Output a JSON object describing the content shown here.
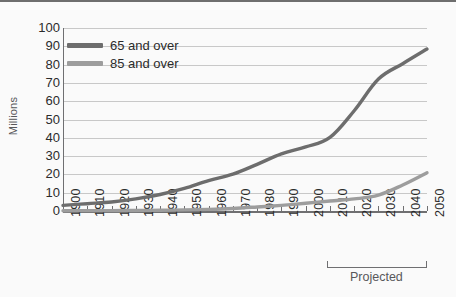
{
  "chart_data": {
    "type": "line",
    "title": "",
    "xlabel": "",
    "ylabel": "Millions",
    "ylim": [
      0,
      100
    ],
    "ytick_step": 10,
    "grid": true,
    "legend_position": "top-left-inside",
    "categories": [
      "1900",
      "1910",
      "1920",
      "1930",
      "1940",
      "1950",
      "1960",
      "1970",
      "1980",
      "1990",
      "2000",
      "2010",
      "2020",
      "2030",
      "2040",
      "2050"
    ],
    "yticks": [
      "0",
      "10",
      "20",
      "30",
      "40",
      "50",
      "60",
      "70",
      "80",
      "90",
      "100"
    ],
    "series": [
      {
        "name": "65 and over",
        "color": "#6d6d6d",
        "values": [
          3.1,
          4.0,
          4.9,
          6.6,
          9.0,
          12.3,
          16.6,
          20.1,
          25.5,
          31.2,
          35.0,
          40.2,
          54.8,
          72.1,
          80.5,
          88.5
        ]
      },
      {
        "name": "85 and over",
        "color": "#9d9d9d",
        "values": [
          0.1,
          0.2,
          0.2,
          0.3,
          0.4,
          0.6,
          0.9,
          1.4,
          2.2,
          3.1,
          4.2,
          5.5,
          6.6,
          8.7,
          14.2,
          20.9
        ]
      }
    ],
    "annotations": [
      {
        "text": "Projected",
        "type": "bracket",
        "from": "2010",
        "to": "2050"
      }
    ]
  },
  "legend": {
    "items": [
      {
        "label": "65 and over"
      },
      {
        "label": "85 and over"
      }
    ]
  },
  "annotation": {
    "projected_label": "Projected"
  },
  "colors": {
    "series_65": "#6d6d6d",
    "series_85": "#9d9d9d",
    "gridline": "#c8c8c8",
    "axis": "#6f6f71",
    "background": "#fafafa",
    "text": "#2b2b2b"
  }
}
